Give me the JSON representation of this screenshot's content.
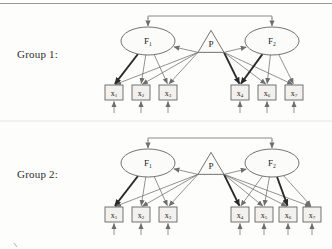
{
  "figure": {
    "type": "path-diagram",
    "groups": [
      {
        "id": "group1",
        "label": "Group 1:",
        "label_x": 17,
        "label_y": 48,
        "offset_y": 0,
        "factors": [
          {
            "name": "F",
            "sub": "1",
            "cx": 148,
            "cy": 41,
            "rx": 27,
            "ry": 14
          },
          {
            "name": "F",
            "sub": "2",
            "cx": 272,
            "cy": 41,
            "rx": 27,
            "ry": 14
          }
        ],
        "method_factor": {
          "name": "P",
          "cx": 211,
          "cy": 44,
          "half_width": 13,
          "height": 22
        },
        "indicators": [
          {
            "name": "x",
            "sub": "1",
            "x": 105,
            "y": 85
          },
          {
            "name": "x",
            "sub": "2",
            "x": 132,
            "y": 85
          },
          {
            "name": "x",
            "sub": "3",
            "x": 159,
            "y": 85
          },
          {
            "name": "x",
            "sub": "4",
            "x": 231,
            "y": 85
          },
          {
            "name": "x",
            "sub": "6",
            "x": 258,
            "y": 85
          },
          {
            "name": "x",
            "sub": "7",
            "x": 285,
            "y": 85
          }
        ],
        "loadings_f1": [
          0,
          1,
          2
        ],
        "loadings_f2": [
          3,
          4,
          5
        ],
        "bold_loadings": [
          0,
          3
        ],
        "method_targets": [
          0,
          1,
          2,
          3,
          4,
          5
        ],
        "method_bold_targets": [
          3
        ],
        "top_bracket": {
          "y": 16,
          "x1": 148,
          "x2": 272
        }
      },
      {
        "id": "group2",
        "label": "Group 2:",
        "label_x": 17,
        "label_y": 168,
        "offset_y": 122,
        "factors": [
          {
            "name": "F",
            "sub": "1",
            "cx": 148,
            "cy": 41,
            "rx": 27,
            "ry": 14
          },
          {
            "name": "F",
            "sub": "2",
            "cx": 272,
            "cy": 41,
            "rx": 27,
            "ry": 14
          }
        ],
        "method_factor": {
          "name": "P",
          "cx": 211,
          "cy": 44,
          "half_width": 13,
          "height": 22
        },
        "indicators": [
          {
            "name": "x",
            "sub": "1",
            "x": 105,
            "y": 85
          },
          {
            "name": "x",
            "sub": "2",
            "x": 132,
            "y": 85
          },
          {
            "name": "x",
            "sub": "3",
            "x": 159,
            "y": 85
          },
          {
            "name": "x",
            "sub": "4",
            "x": 231,
            "y": 85
          },
          {
            "name": "x",
            "sub": "5",
            "x": 255,
            "y": 85
          },
          {
            "name": "x",
            "sub": "6",
            "x": 279,
            "y": 85
          },
          {
            "name": "x",
            "sub": "7",
            "x": 303,
            "y": 85
          }
        ],
        "loadings_f1": [
          0,
          1,
          2
        ],
        "loadings_f2": [
          3,
          4,
          5,
          6
        ],
        "bold_loadings": [
          0,
          5
        ],
        "method_targets": [
          0,
          1,
          2,
          3,
          4,
          5,
          6
        ],
        "method_bold_targets": [
          3
        ],
        "top_bracket": {
          "y": 16,
          "x1": 148,
          "x2": 272
        }
      }
    ],
    "box": {
      "w": 18,
      "h": 15
    },
    "residual_arrow_length": 13,
    "colors": {
      "line": "#6e6e6e",
      "line_bold": "#2a2a2a",
      "node_stroke": "#5a5a5a",
      "box_fill": "#f2f1ee",
      "text": "#1d1d1d",
      "rule": "#8f8f8f"
    }
  }
}
